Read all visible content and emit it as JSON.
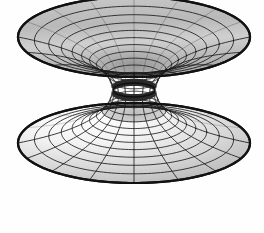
{
  "figure": {
    "background_color": "#fefefe",
    "mesh_color": "#1a1a1a",
    "rim_color": "#111111",
    "surface_light": "#fdfdfd",
    "surface_mid": "#c6c6c6",
    "surface_dark": "#9a9a9a",
    "throat_color": "#2a2a2a"
  },
  "chart_data": {
    "type": "line",
    "subtitle": "",
    "xlabel": "",
    "ylabel": "",
    "grid": false,
    "legend": null,
    "surface": {
      "family": "catenoid / hyperboloid of one sheet",
      "equation": "r(z) = a * cosh(z / a)",
      "throat_radius_a": 1.0,
      "z_range": [
        -2.35,
        2.35
      ],
      "theta_range_deg": [
        0,
        360
      ],
      "u_samples": 13,
      "v_samples": 16
    },
    "projection": {
      "type": "oblique-parallel",
      "center_x": 134,
      "center_y": 90,
      "x_scale": 116,
      "y_squash": 0.345,
      "z_scale": 53,
      "elevation_deg": 20
    },
    "rings": {
      "count_upper": 11,
      "count_lower": 11,
      "top_rim": {
        "cx": 134,
        "cy": 37,
        "rx": 116,
        "ry": 40
      },
      "bottom_rim": {
        "cx": 133,
        "cy": 176,
        "rx": 96,
        "ry": 38
      },
      "throat": {
        "cx": 134,
        "cy": 90,
        "rx": 21,
        "ry": 7
      }
    },
    "meridians": {
      "count": 16,
      "visible_count": 8
    },
    "extents": {
      "left_px": 17,
      "right_px": 250,
      "top_px": 9,
      "bottom_px": 216
    }
  }
}
